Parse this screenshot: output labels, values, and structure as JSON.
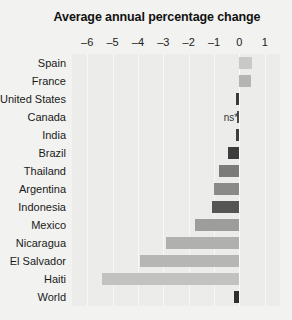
{
  "chart_data": {
    "type": "bar",
    "orientation": "horizontal",
    "title": "Average annual percentage change",
    "xlabel": "",
    "ylabel": "",
    "xlim": [
      -6.6,
      1.6
    ],
    "xticks": [
      -6,
      -5,
      -4,
      -3,
      -2,
      -1,
      0,
      1
    ],
    "xtick_labels": [
      "–6",
      "–5",
      "–4",
      "–3",
      "–2",
      "–1",
      "0",
      "1"
    ],
    "grid": true,
    "legend": null,
    "categories": [
      "Spain",
      "France",
      "United States",
      "Canada",
      "India",
      "Brazil",
      "Thailand",
      "Argentina",
      "Indonesia",
      "Mexico",
      "Nicaragua",
      "El Salvador",
      "Haiti",
      "World"
    ],
    "values": [
      0.5,
      0.45,
      -0.15,
      -0.1,
      -0.12,
      -0.45,
      -0.8,
      -1.0,
      -1.1,
      -1.75,
      -2.9,
      -3.9,
      -5.4,
      -0.2
    ],
    "bar_colors": [
      "#c9c9c7",
      "#b4b4b2",
      "#3a3a3a",
      "#4a4a4a",
      "#3f3f3f",
      "#3d3d3d",
      "#7b7b79",
      "#8a8a88",
      "#555553",
      "#9d9d9b",
      "#b0b0ae",
      "#b6b6b4",
      "#c2c2c0",
      "#2f2f2f"
    ],
    "annotations": [
      {
        "category": "Canada",
        "text": "ns*",
        "x": -0.62
      }
    ],
    "colors": {
      "background": "#f2f2f0",
      "plot_background": "#ececea",
      "gridline": "#f7f7f5",
      "text": "#1a1a1a"
    }
  }
}
